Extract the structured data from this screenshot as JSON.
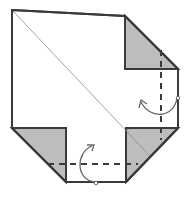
{
  "diagram": {
    "type": "origami-fold-step",
    "colors": {
      "background": "#ffffff",
      "outline": "#3a3a3a",
      "shaded_flap": "#bdbdbd",
      "crease": "#8a8a8a",
      "dashed_fold": "#3a3a3a",
      "arrow": "#666666"
    },
    "outline_points": "12,10 125,16 178,69 178,128 126,182 66,182 12,128",
    "flaps": [
      {
        "name": "top-right-flap",
        "points": "125,16 125,69 178,69"
      },
      {
        "name": "bottom-left-flap",
        "points": "12,128 66,128 66,182"
      },
      {
        "name": "bottom-right-flap",
        "points": "126,128 178,128 126,182"
      }
    ],
    "diagonal_crease": {
      "x1": 12,
      "y1": 10,
      "x2": 150,
      "y2": 156
    },
    "valley_folds": [
      {
        "name": "vertical-valley-fold",
        "x1": 161,
        "y1": 50,
        "x2": 161,
        "y2": 140
      },
      {
        "name": "horizontal-valley-fold",
        "x1": 48,
        "y1": 164,
        "x2": 138,
        "y2": 164
      }
    ],
    "fold_arrows": [
      {
        "name": "right-fold-arrow",
        "direction": "fold-behind"
      },
      {
        "name": "bottom-fold-arrow",
        "direction": "fold-behind"
      }
    ]
  }
}
